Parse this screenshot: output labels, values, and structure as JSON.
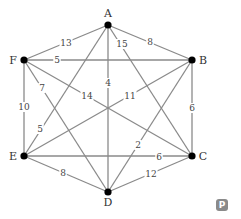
{
  "nodes": [
    {
      "id": "A",
      "x": 108,
      "y": 25,
      "lx": 108,
      "ly": 14
    },
    {
      "id": "B",
      "x": 192,
      "y": 60,
      "lx": 203,
      "ly": 61
    },
    {
      "id": "C",
      "x": 192,
      "y": 156,
      "lx": 203,
      "ly": 157
    },
    {
      "id": "D",
      "x": 108,
      "y": 192,
      "lx": 108,
      "ly": 203
    },
    {
      "id": "E",
      "x": 24,
      "y": 156,
      "lx": 13,
      "ly": 157
    },
    {
      "id": "F",
      "x": 24,
      "y": 60,
      "lx": 13,
      "ly": 61
    }
  ],
  "edges": [
    {
      "from": "A",
      "to": "F",
      "weight": "13",
      "lx": 66,
      "ly": 43
    },
    {
      "from": "A",
      "to": "B",
      "weight": "8",
      "lx": 150,
      "ly": 42
    },
    {
      "from": "A",
      "to": "C",
      "weight": "15",
      "lx": 122,
      "ly": 44
    },
    {
      "from": "A",
      "to": "D",
      "weight": "4",
      "lx": 108,
      "ly": 83
    },
    {
      "from": "A",
      "to": "E",
      "weight": "5",
      "lx": 40,
      "ly": 129
    },
    {
      "from": "F",
      "to": "B",
      "weight": "5",
      "lx": 57,
      "ly": 60
    },
    {
      "from": "F",
      "to": "C",
      "weight": "14",
      "lx": 87,
      "ly": 96
    },
    {
      "from": "F",
      "to": "D",
      "weight": "7",
      "lx": 42,
      "ly": 88
    },
    {
      "from": "F",
      "to": "E",
      "weight": "10",
      "lx": 24,
      "ly": 107
    },
    {
      "from": "B",
      "to": "E",
      "weight": "11",
      "lx": 130,
      "ly": 96
    },
    {
      "from": "B",
      "to": "D",
      "weight": "2",
      "lx": 138,
      "ly": 145
    },
    {
      "from": "B",
      "to": "C",
      "weight": "6",
      "lx": 192,
      "ly": 108
    },
    {
      "from": "E",
      "to": "C",
      "weight": "6",
      "lx": 159,
      "ly": 157
    },
    {
      "from": "E",
      "to": "D",
      "weight": "8",
      "lx": 63,
      "ly": 173
    },
    {
      "from": "D",
      "to": "C",
      "weight": "12",
      "lx": 151,
      "ly": 174
    }
  ],
  "badge": {
    "label": "P"
  }
}
